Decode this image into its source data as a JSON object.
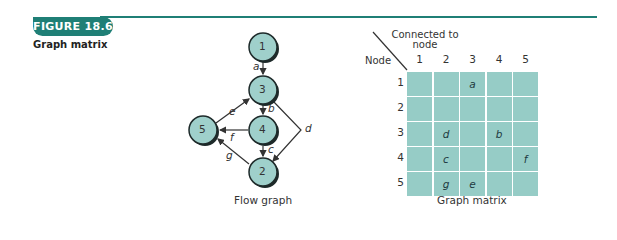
{
  "figure": {
    "badge": "FIGURE 18.6",
    "title": "Graph matrix",
    "accent_color": "#1f7f76"
  },
  "flow_graph": {
    "caption": "Flow graph",
    "node_fill": "#9fd0cb",
    "nodes": [
      {
        "id": "1",
        "label": "1"
      },
      {
        "id": "2",
        "label": "2"
      },
      {
        "id": "3",
        "label": "3"
      },
      {
        "id": "4",
        "label": "4"
      },
      {
        "id": "5",
        "label": "5"
      }
    ],
    "edges": [
      {
        "label": "a",
        "from": "1",
        "to": "3"
      },
      {
        "label": "b",
        "from": "3",
        "to": "4"
      },
      {
        "label": "c",
        "from": "4",
        "to": "2"
      },
      {
        "label": "d",
        "from": "3",
        "to": "2"
      },
      {
        "label": "e",
        "from": "5",
        "to": "3"
      },
      {
        "label": "f",
        "from": "4",
        "to": "5"
      },
      {
        "label": "g",
        "from": "2",
        "to": "5"
      }
    ]
  },
  "graph_matrix": {
    "caption": "Graph matrix",
    "header_top": "Connected to",
    "header_top2": "node",
    "header_left": "Node",
    "columns": [
      "1",
      "2",
      "3",
      "4",
      "5"
    ],
    "rows": [
      "1",
      "2",
      "3",
      "4",
      "5"
    ],
    "cells": [
      [
        "",
        "",
        "a",
        "",
        ""
      ],
      [
        "",
        "",
        "",
        "",
        ""
      ],
      [
        "",
        "d",
        "",
        "b",
        ""
      ],
      [
        "",
        "c",
        "",
        "",
        "f"
      ],
      [
        "",
        "g",
        "e",
        "",
        ""
      ]
    ],
    "cell_color": "#96ccc6"
  }
}
